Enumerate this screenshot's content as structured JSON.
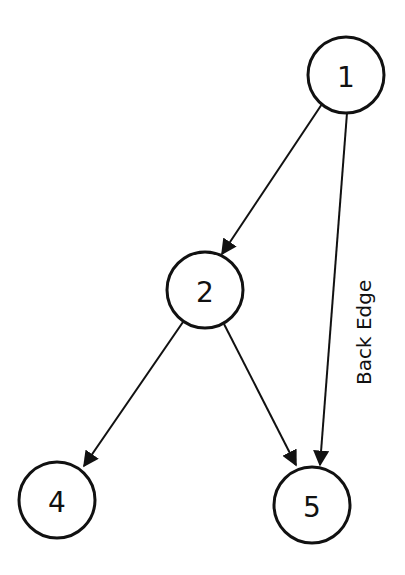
{
  "diagram": {
    "type": "directed-graph",
    "nodes": [
      {
        "id": "1",
        "label": "1",
        "cx": 346,
        "cy": 75
      },
      {
        "id": "2",
        "label": "2",
        "cx": 205,
        "cy": 290
      },
      {
        "id": "4",
        "label": "4",
        "cx": 57,
        "cy": 500
      },
      {
        "id": "5",
        "label": "5",
        "cx": 312,
        "cy": 505
      }
    ],
    "edges": [
      {
        "from": "1",
        "to": "2"
      },
      {
        "from": "1",
        "to": "5",
        "label": "Back Edge"
      },
      {
        "from": "2",
        "to": "4"
      },
      {
        "from": "2",
        "to": "5"
      }
    ],
    "edge_label": "Back Edge"
  }
}
